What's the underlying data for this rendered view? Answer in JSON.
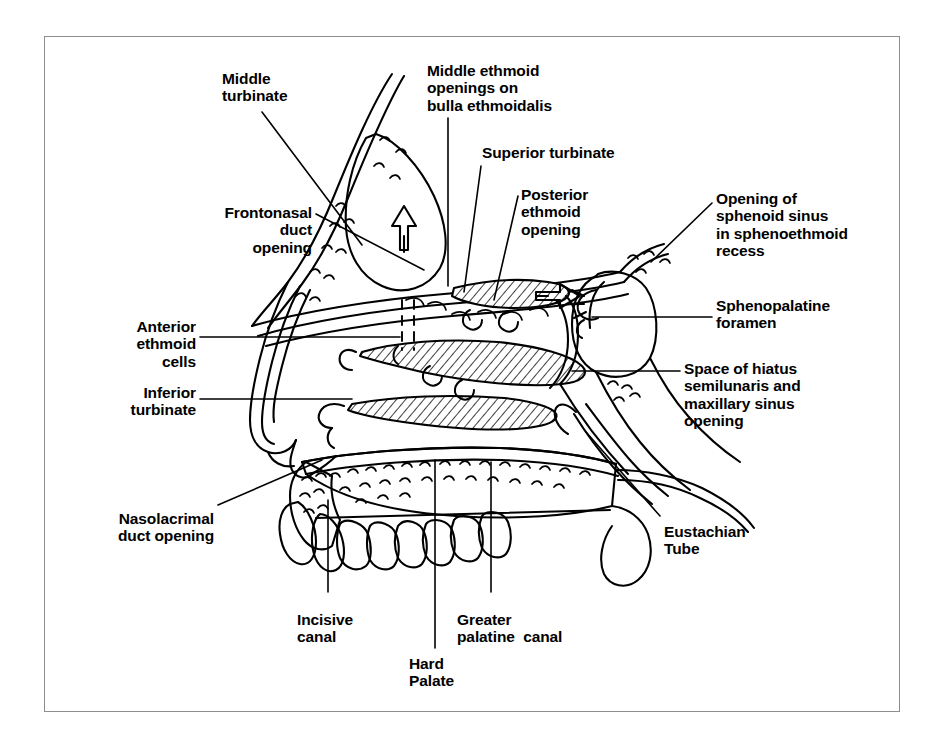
{
  "figure": {
    "style": {
      "ink": "#000000",
      "paper": "#ffffff",
      "frame": "#8d8d8d"
    }
  },
  "labels": [
    {
      "id": "middle-turbinate",
      "lines": [
        "Middle",
        "turbinate"
      ],
      "x": 222,
      "y": 70,
      "align": "left"
    },
    {
      "id": "middle-ethmoid",
      "lines": [
        "Middle ethmoid",
        "openings on",
        "bulla ethmoidalis"
      ],
      "x": 427,
      "y": 62,
      "align": "left"
    },
    {
      "id": "superior-turbinate",
      "lines": [
        "Superior turbinate"
      ],
      "x": 482,
      "y": 144,
      "align": "left"
    },
    {
      "id": "posterior-ethmoid",
      "lines": [
        "Posterior",
        "ethmoid",
        "opening"
      ],
      "x": 521,
      "y": 186,
      "align": "left"
    },
    {
      "id": "sphenoid-opening",
      "lines": [
        "Opening of",
        "sphenoid sinus",
        "in sphenoethmoid",
        "recess"
      ],
      "x": 716,
      "y": 190,
      "align": "left"
    },
    {
      "id": "sphenopalatine-foramen",
      "lines": [
        "Sphenopalatine",
        "foramen"
      ],
      "x": 716,
      "y": 297,
      "align": "left"
    },
    {
      "id": "space-hiatus",
      "lines": [
        "Space of hiatus",
        "semilunaris and",
        "maxillary sinus",
        "opening"
      ],
      "x": 684,
      "y": 360,
      "align": "left"
    },
    {
      "id": "frontonasal-duct",
      "lines": [
        "Frontonasal",
        "duct",
        "opening"
      ],
      "x": 312,
      "y": 204,
      "align": "right"
    },
    {
      "id": "anterior-ethmoid",
      "lines": [
        "Anterior",
        "ethmoid",
        "cells"
      ],
      "x": 196,
      "y": 318,
      "align": "right"
    },
    {
      "id": "inferior-turbinate",
      "lines": [
        "Inferior",
        "turbinate"
      ],
      "x": 196,
      "y": 384,
      "align": "right"
    },
    {
      "id": "nasolacrimal-duct",
      "lines": [
        "Nasolacrimal",
        "duct opening"
      ],
      "x": 214,
      "y": 510,
      "align": "right"
    },
    {
      "id": "incisive-canal",
      "lines": [
        "Incisive",
        "canal"
      ],
      "x": 297,
      "y": 611,
      "align": "left"
    },
    {
      "id": "hard-palate",
      "lines": [
        "Hard",
        "Palate"
      ],
      "x": 409,
      "y": 655,
      "align": "left"
    },
    {
      "id": "greater-palatine",
      "lines": [
        "Greater",
        "palatine  canal"
      ],
      "x": 457,
      "y": 611,
      "align": "left"
    },
    {
      "id": "eustachian-tube",
      "lines": [
        "Eustachian",
        "Tube"
      ],
      "x": 664,
      "y": 523,
      "align": "left"
    }
  ],
  "leaders": [
    {
      "id": "leader-middle-turbinate",
      "d": "M 262 112 L 362 245"
    },
    {
      "id": "leader-middle-ethmoid",
      "d": "M 448 118 L 448 286"
    },
    {
      "id": "leader-superior-turbinate",
      "d": "M 481 166 L 464 292"
    },
    {
      "id": "leader-posterior-ethmoid",
      "d": "M 518 196 L 494 300"
    },
    {
      "id": "leader-sphenoid-opening",
      "d": "M 712 203 L 651 262"
    },
    {
      "id": "leader-sphenopalatine",
      "d": "M 712 317 L 592 317"
    },
    {
      "id": "leader-space-hiatus",
      "d": "M 680 371 L 572 371"
    },
    {
      "id": "leader-frontonasal",
      "d": "M 316 214 L 424 270"
    },
    {
      "id": "leader-anterior-ethmoid",
      "d": "M 200 337 L 400 337"
    },
    {
      "id": "leader-inferior-turbinate",
      "d": "M 200 399 L 352 399"
    },
    {
      "id": "leader-nasolacrimal",
      "d": "M 218 505 L 322 460"
    },
    {
      "id": "leader-incisive",
      "d": "M 328 592 L 328 500"
    },
    {
      "id": "leader-hard-palate",
      "d": "M 435 648 L 435 460"
    },
    {
      "id": "leader-greater-palatine",
      "d": "M 491 592 L 491 462"
    },
    {
      "id": "leader-eustachian",
      "d": "M 660 516 L 586 432"
    }
  ]
}
